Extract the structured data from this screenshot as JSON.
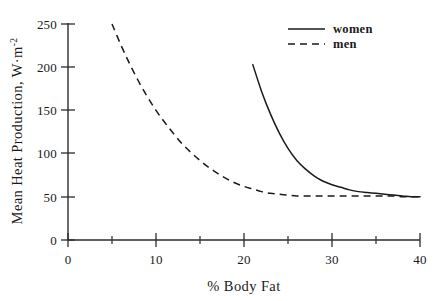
{
  "chart_data": {
    "type": "line",
    "title": "",
    "xlabel": "% Body Fat",
    "ylabel": "Mean Heat Production, W·m",
    "ylabel_exponent": "-2",
    "xlim": [
      0,
      40
    ],
    "ylim": [
      0,
      250
    ],
    "xticks": [
      0,
      10,
      20,
      30,
      40
    ],
    "xtick_labels": [
      "0",
      "10",
      "20",
      "30",
      "40"
    ],
    "xminorticks": [
      5,
      15,
      25,
      35
    ],
    "yticks": [
      0,
      50,
      100,
      150,
      200,
      250
    ],
    "ytick_labels": [
      "0",
      "50",
      "100",
      "150",
      "200",
      "250"
    ],
    "grid": false,
    "legend_position": "top-right",
    "series": [
      {
        "name": "women",
        "style": "solid",
        "color": "#1a1a1a",
        "x": [
          21,
          22,
          23,
          24,
          25,
          26,
          27,
          28,
          29,
          30,
          31,
          32,
          33,
          34,
          35,
          36,
          37,
          38,
          39,
          40
        ],
        "y": [
          203,
          172,
          146,
          124,
          106,
          92,
          82,
          74,
          68,
          64,
          61,
          58,
          56,
          55,
          54,
          53,
          52,
          51,
          50,
          50
        ]
      },
      {
        "name": "men",
        "style": "dashed",
        "color": "#1a1a1a",
        "x": [
          5,
          6,
          7,
          8,
          9,
          10,
          11,
          12,
          13,
          14,
          15,
          16,
          17,
          18,
          19,
          20,
          21,
          22,
          23,
          24,
          25,
          26,
          27,
          28,
          29,
          30,
          31,
          32,
          33,
          34,
          35,
          36,
          37,
          38,
          39,
          40
        ],
        "y": [
          250,
          226,
          204,
          184,
          166,
          150,
          136,
          123,
          111,
          101,
          92,
          84,
          77,
          71,
          66,
          62,
          59,
          56,
          54,
          53,
          52,
          51,
          51,
          51,
          51,
          51,
          51,
          51,
          51,
          51,
          51,
          51,
          51,
          50,
          50,
          50
        ]
      }
    ]
  },
  "legend": {
    "items": [
      {
        "label": "women",
        "style": "solid"
      },
      {
        "label": "men",
        "style": "dashed"
      }
    ]
  }
}
